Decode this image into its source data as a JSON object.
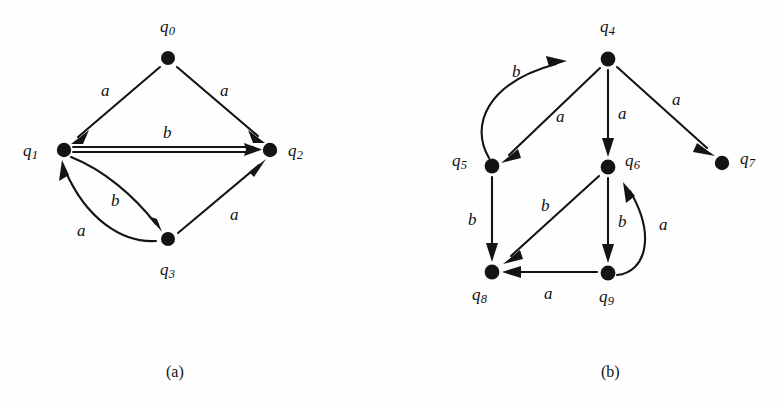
{
  "figure": {
    "background_color": "#fefefe",
    "ink_color": "#141414",
    "panels": [
      {
        "id": "panel-a",
        "caption": "(a)",
        "caption_pos": {
          "x": 166,
          "y": 364
        },
        "nodes": [
          {
            "id": "q0",
            "label": "q",
            "sub": "0",
            "x": 168,
            "y": 58,
            "r": 7.0,
            "label_pos": {
              "x": 160,
              "y": 18
            }
          },
          {
            "id": "q1",
            "label": "q",
            "sub": "1",
            "x": 64,
            "y": 150,
            "r": 7.2,
            "label_pos": {
              "x": 23,
              "y": 142
            }
          },
          {
            "id": "q2",
            "label": "q",
            "sub": "2",
            "x": 270,
            "y": 150,
            "r": 7.2,
            "label_pos": {
              "x": 288,
              "y": 142
            }
          },
          {
            "id": "q3",
            "label": "q",
            "sub": "3",
            "x": 168,
            "y": 239,
            "r": 7.0,
            "label_pos": {
              "x": 160,
              "y": 261
            }
          }
        ],
        "edges": [
          {
            "id": "e-q0-q1",
            "from": "q0",
            "to": "q1",
            "symbol": "a",
            "shape": "straight",
            "label_pos": {
              "x": 101,
              "y": 82
            }
          },
          {
            "id": "e-q0-q2",
            "from": "q0",
            "to": "q2",
            "symbol": "a",
            "shape": "straight",
            "label_pos": {
              "x": 220,
              "y": 82
            }
          },
          {
            "id": "e-q1-q2",
            "from": "q1",
            "to": "q2",
            "symbol": "b",
            "shape": "straight",
            "label_pos": {
              "x": 163,
              "y": 124
            }
          },
          {
            "id": "e-q1-q3",
            "from": "q1",
            "to": "q3",
            "symbol": "b",
            "shape": "curve",
            "label_pos": {
              "x": 111,
              "y": 192
            }
          },
          {
            "id": "e-q3-q1",
            "from": "q3",
            "to": "q1",
            "symbol": "a",
            "shape": "curve",
            "label_pos": {
              "x": 77,
              "y": 222
            }
          },
          {
            "id": "e-q3-q2",
            "from": "q3",
            "to": "q2",
            "symbol": "a",
            "shape": "straight",
            "label_pos": {
              "x": 230,
              "y": 206
            }
          }
        ]
      },
      {
        "id": "panel-b",
        "caption": "(b)",
        "caption_pos": {
          "x": 601,
          "y": 364
        },
        "nodes": [
          {
            "id": "q4",
            "label": "q",
            "sub": "4",
            "x": 608,
            "y": 59,
            "r": 7.4,
            "label_pos": {
              "x": 600,
              "y": 18
            }
          },
          {
            "id": "q5",
            "label": "q",
            "sub": "5",
            "x": 492,
            "y": 166,
            "r": 7.4,
            "label_pos": {
              "x": 452,
              "y": 152
            }
          },
          {
            "id": "q6",
            "label": "q",
            "sub": "6",
            "x": 608,
            "y": 167,
            "r": 7.4,
            "label_pos": {
              "x": 625,
              "y": 152
            }
          },
          {
            "id": "q7",
            "label": "q",
            "sub": "7",
            "x": 722,
            "y": 163,
            "r": 7.2,
            "label_pos": {
              "x": 740,
              "y": 150
            }
          },
          {
            "id": "q8",
            "label": "q",
            "sub": "8",
            "x": 492,
            "y": 272,
            "r": 7.4,
            "label_pos": {
              "x": 472,
              "y": 286
            }
          },
          {
            "id": "q9",
            "label": "q",
            "sub": "9",
            "x": 608,
            "y": 273,
            "r": 7.4,
            "label_pos": {
              "x": 599,
              "y": 288
            }
          }
        ],
        "edges": [
          {
            "id": "e-q5-q4",
            "from": "q5",
            "to": "q4",
            "symbol": "b",
            "shape": "curve",
            "label_pos": {
              "x": 512,
              "y": 63
            }
          },
          {
            "id": "e-q4-q5",
            "from": "q4",
            "to": "q5",
            "symbol": "a",
            "shape": "straight",
            "label_pos": {
              "x": 556,
              "y": 108
            }
          },
          {
            "id": "e-q4-q6",
            "from": "q4",
            "to": "q6",
            "symbol": "a",
            "shape": "straight",
            "label_pos": {
              "x": 618,
              "y": 105
            }
          },
          {
            "id": "e-q4-q7",
            "from": "q4",
            "to": "q7",
            "symbol": "a",
            "shape": "straight",
            "label_pos": {
              "x": 672,
              "y": 91
            }
          },
          {
            "id": "e-q5-q8",
            "from": "q5",
            "to": "q8",
            "symbol": "b",
            "shape": "straight",
            "label_pos": {
              "x": 468,
              "y": 211
            }
          },
          {
            "id": "e-q6-q8",
            "from": "q6",
            "to": "q8",
            "symbol": "b",
            "shape": "straight",
            "label_pos": {
              "x": 541,
              "y": 197
            }
          },
          {
            "id": "e-q6-q9",
            "from": "q6",
            "to": "q9",
            "symbol": "b",
            "shape": "straight",
            "label_pos": {
              "x": 618,
              "y": 213
            }
          },
          {
            "id": "e-q9-q6",
            "from": "q9",
            "to": "q6",
            "symbol": "a",
            "shape": "curve",
            "label_pos": {
              "x": 659,
              "y": 216
            }
          },
          {
            "id": "e-q9-q8",
            "from": "q9",
            "to": "q8",
            "symbol": "a",
            "shape": "straight",
            "label_pos": {
              "x": 544,
              "y": 285
            }
          }
        ]
      }
    ]
  }
}
